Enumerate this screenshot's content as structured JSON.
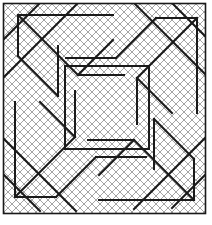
{
  "figure": {
    "type": "line-diagram",
    "width": 212,
    "height": 225,
    "symmetry": "4-fold rotational (C4)",
    "caption": ""
  },
  "colors": {
    "background": "#ffffff",
    "hatch": "#9a9a9a",
    "knot_stroke": "#1a1a1a",
    "frame_stroke": "#1a1a1a"
  },
  "strokes": {
    "hatch_width": 0.9,
    "knot_width": 2.0,
    "frame_width": 1.6
  },
  "hatch": {
    "name": "diagonal-cross-hatch",
    "spacing": 8,
    "angles_deg": [
      45,
      -45
    ],
    "region": {
      "x": 3,
      "y": 3,
      "width": 203,
      "height": 211
    }
  },
  "frame": {
    "name": "outer-frame-rectangle",
    "x": 3.5,
    "y": 3.5,
    "width": 202,
    "height": 210
  },
  "center_square": {
    "name": "central-square",
    "x": 65,
    "y": 66,
    "width": 84,
    "height": 83
  },
  "knot_paths": [
    {
      "id": "tl-chevron-outer",
      "d": "M 18 56 L 18 15 L 113 15"
    },
    {
      "id": "tl-chevron-diag",
      "d": "M 18 15 L 78 75"
    },
    {
      "id": "tl-hook-diag",
      "d": "M 78 75 L 113 40"
    },
    {
      "id": "tl-hook-horiz",
      "d": "M 78 75 L 124 75"
    },
    {
      "id": "tl-small-diag",
      "d": "M 18 56 L 58 96"
    },
    {
      "id": "tl-vert-stub",
      "d": "M 58 96 L 58 46"
    },
    {
      "id": "tr-chevron-outer",
      "d": "M 156 18 L 197 18 L 197 113"
    },
    {
      "id": "tr-chevron-diag",
      "d": "M 197 18 L 137 78"
    },
    {
      "id": "tr-hook-diag",
      "d": "M 137 78 L 172 113"
    },
    {
      "id": "tr-hook-vert",
      "d": "M 137 78 L 137 124"
    },
    {
      "id": "tr-small-diag",
      "d": "M 156 18 L 116 58"
    },
    {
      "id": "tr-horiz-stub",
      "d": "M 116 58 L 66 58"
    },
    {
      "id": "br-chevron-outer",
      "d": "M 194 159 L 194 200 L 99 200"
    },
    {
      "id": "br-chevron-diag",
      "d": "M 194 200 L 134 140"
    },
    {
      "id": "br-hook-diag",
      "d": "M 134 140 L 99 175"
    },
    {
      "id": "br-hook-horiz",
      "d": "M 134 140 L 88 140"
    },
    {
      "id": "br-small-diag",
      "d": "M 194 159 L 154 119"
    },
    {
      "id": "br-vert-stub",
      "d": "M 154 119 L 154 169"
    },
    {
      "id": "bl-chevron-outer",
      "d": "M 56 197 L 15 197 L 15 102"
    },
    {
      "id": "bl-chevron-diag",
      "d": "M 15 197 L 75 137"
    },
    {
      "id": "bl-hook-diag",
      "d": "M 75 137 L 40 102"
    },
    {
      "id": "bl-hook-vert",
      "d": "M 75 137 L 75 91"
    },
    {
      "id": "bl-small-diag",
      "d": "M 56 197 L 96 157"
    },
    {
      "id": "bl-horiz-stub",
      "d": "M 96 157 L 146 157"
    },
    {
      "id": "corner-tl-long-diag",
      "d": "M 3 78 L 78 3"
    },
    {
      "id": "corner-tr-long-diag",
      "d": "M 134 3 L 206 75"
    },
    {
      "id": "corner-br-long-diag",
      "d": "M 206 137 L 134 209"
    },
    {
      "id": "corner-bl-long-diag",
      "d": "M 76 211 L 3 138"
    },
    {
      "id": "edge-tl-short-diag",
      "d": "M 3 40 L 40 3"
    },
    {
      "id": "edge-tr-short-diag",
      "d": "M 172 3 L 206 37"
    },
    {
      "id": "edge-br-short-diag",
      "d": "M 206 174 L 172 208"
    },
    {
      "id": "edge-bl-short-diag",
      "d": "M 40 211 L 3 174"
    }
  ],
  "center_square_edges": [
    {
      "id": "center-top",
      "d": "M 65 66 L 149 66"
    },
    {
      "id": "center-right",
      "d": "M 149 66 L 149 149"
    },
    {
      "id": "center-bottom",
      "d": "M 149 149 L 65 149"
    },
    {
      "id": "center-left",
      "d": "M 65 149 L 65 66"
    }
  ]
}
